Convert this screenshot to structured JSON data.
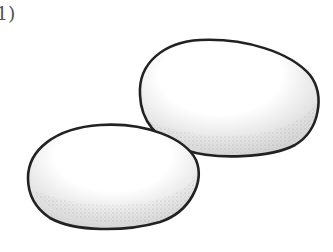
{
  "figure": {
    "label": "1)",
    "colors": {
      "outline": "#222222",
      "stipple": "#444444",
      "background": "#ffffff"
    }
  }
}
